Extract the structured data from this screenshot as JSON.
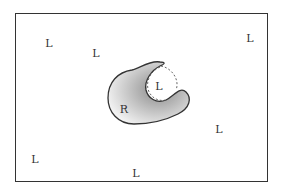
{
  "diagram": {
    "receptor": {
      "label": "R",
      "x": 124,
      "y": 109
    },
    "bound_ligand": {
      "label": "L",
      "x": 159,
      "y": 86
    },
    "free_ligands": [
      {
        "label": "L",
        "x": 49,
        "y": 43
      },
      {
        "label": "L",
        "x": 96,
        "y": 53
      },
      {
        "label": "L",
        "x": 250,
        "y": 38
      },
      {
        "label": "L",
        "x": 219,
        "y": 129
      },
      {
        "label": "L",
        "x": 35,
        "y": 159
      },
      {
        "label": "L",
        "x": 136,
        "y": 173
      }
    ],
    "colors": {
      "border": "#333333",
      "shade_dark": "#8a8a8a",
      "shade_light": "#f2f2f2"
    }
  }
}
